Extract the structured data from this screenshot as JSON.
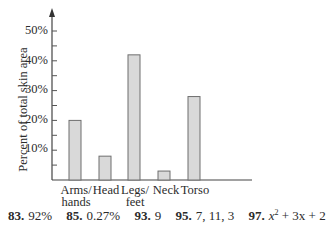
{
  "chart_data": {
    "type": "bar",
    "title": "",
    "xlabel": "",
    "ylabel": "Percent of total skin area",
    "categories": [
      "Arms/ hands",
      "Head",
      "Legs/ feet",
      "Neck",
      "Torso"
    ],
    "values": [
      20,
      8,
      42,
      3,
      28
    ],
    "yticks": [
      "10%",
      "20%",
      "30%",
      "40%",
      "50%"
    ],
    "ylim": [
      0,
      50
    ],
    "grid": false,
    "bar_fill": "#d9d9d9",
    "bar_stroke": "#6e6e6e"
  },
  "labels": {
    "ylabel": "Percent of total skin area",
    "yticks": [
      "50%",
      "40%",
      "30%",
      "20%",
      "10%"
    ],
    "categories": [
      {
        "line1": "Arms/",
        "line2": "hands"
      },
      {
        "line1": "Head",
        "line2": ""
      },
      {
        "line1": "Legs/",
        "line2": "feet"
      },
      {
        "line1": "Neck",
        "line2": ""
      },
      {
        "line1": "Torso",
        "line2": ""
      }
    ]
  },
  "answers": [
    {
      "num": "83.",
      "text": "92%"
    },
    {
      "num": "85.",
      "text": "0.27%"
    },
    {
      "num": "93.",
      "text": "9"
    },
    {
      "num": "95.",
      "text": "7, 11, 3"
    },
    {
      "num": "97.",
      "text_pre": "x",
      "sup": "2",
      "text_post": " + 3x + 2"
    }
  ]
}
